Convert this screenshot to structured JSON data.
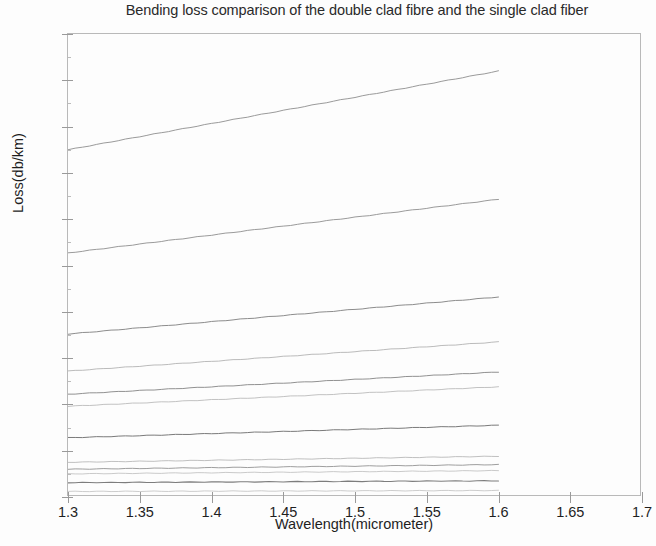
{
  "chart_data": {
    "type": "line",
    "title": "Bending loss comparison of the double clad fibre and the single clad fiber",
    "xlabel": "Wavelength(micrometer)",
    "ylabel": "Loss(db/km)",
    "xlim": [
      1.3,
      1.7
    ],
    "ylim": [
      0,
      1
    ],
    "grid": false,
    "legend": "none",
    "xticks": [
      1.3,
      1.35,
      1.4,
      1.45,
      1.5,
      1.55,
      1.6,
      1.65,
      1.7
    ],
    "xticklabels": [
      "1.3",
      "1.35",
      "1.4",
      "1.45",
      "1.5",
      "1.55",
      "1.6",
      "1.65",
      "1.7"
    ],
    "yticks": [
      0,
      0.1,
      0.2,
      0.3,
      0.4,
      0.5,
      0.6,
      0.7,
      0.8,
      0.9,
      1
    ],
    "yticklabels": [
      "0",
      "0.1",
      "0.2",
      "0.3",
      "0.4",
      "0.5",
      "0.6",
      "0.7",
      "0.8",
      "0.9",
      "1"
    ],
    "line_color": "#8d8d8d",
    "x": [
      1.3,
      1.6
    ],
    "series": [
      {
        "name": "curve-1",
        "values": [
          0.75,
          0.92
        ],
        "width": 0.9,
        "color": "#8e8e8e"
      },
      {
        "name": "curve-2",
        "values": [
          0.527,
          0.643
        ],
        "width": 0.9,
        "color": "#8e8e8e"
      },
      {
        "name": "curve-3",
        "values": [
          0.352,
          0.432
        ],
        "width": 0.9,
        "color": "#7f7f7f"
      },
      {
        "name": "curve-4",
        "values": [
          0.272,
          0.335
        ],
        "width": 0.8,
        "color": "#aaaaaa"
      },
      {
        "name": "curve-5",
        "values": [
          0.222,
          0.27
        ],
        "width": 0.9,
        "color": "#848484"
      },
      {
        "name": "curve-6",
        "values": [
          0.196,
          0.238
        ],
        "width": 0.8,
        "color": "#b2b2b2"
      },
      {
        "name": "curve-7",
        "values": [
          0.128,
          0.155
        ],
        "width": 1.0,
        "color": "#7a7a7a"
      },
      {
        "name": "curve-8",
        "values": [
          0.075,
          0.088
        ],
        "width": 0.8,
        "color": "#b0b0b0"
      },
      {
        "name": "curve-9",
        "values": [
          0.06,
          0.07
        ],
        "width": 0.9,
        "color": "#939393"
      },
      {
        "name": "curve-10",
        "values": [
          0.05,
          0.057
        ],
        "width": 0.8,
        "color": "#bdbdbd"
      },
      {
        "name": "curve-11",
        "values": [
          0.031,
          0.035
        ],
        "width": 1.1,
        "color": "#7d7d7d"
      },
      {
        "name": "curve-12",
        "values": [
          0.012,
          0.014
        ],
        "width": 0.8,
        "color": "#c0c0c0"
      }
    ]
  }
}
